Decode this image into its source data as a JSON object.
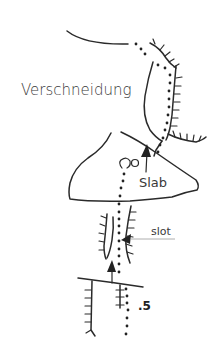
{
  "diagram": {
    "type": "climbing-route-topo",
    "labels": {
      "feature_corner": "Verschneidung",
      "feature_slab": "Slab",
      "feature_slot": "slot",
      "grade": ".5"
    },
    "elements": {
      "route_line": "dotted",
      "belay_symbol": "o",
      "arrows": [
        "up-arrow-slab",
        "up-arrow-lower",
        "arrow-into-slot"
      ]
    },
    "colors": {
      "ink": "#2a2a2a",
      "text": "#3a3a3a",
      "leader": "#9a9a9a",
      "background": "#ffffff"
    }
  }
}
